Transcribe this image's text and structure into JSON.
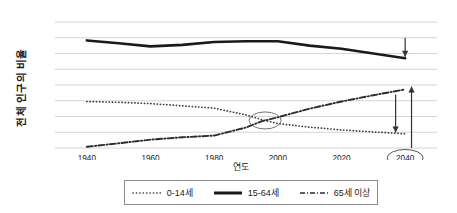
{
  "chart_data": {
    "type": "line",
    "title": "",
    "xlabel": "연도",
    "ylabel": "전체 인구의 비율",
    "xlim": [
      1930,
      2050
    ],
    "ylim": [
      0,
      80
    ],
    "yticks": [
      0,
      10,
      20,
      30,
      40,
      50,
      60,
      70,
      80
    ],
    "xticks": [
      1940,
      1960,
      1980,
      2000,
      2020,
      2040
    ],
    "grid": true,
    "legend_position": "bottom",
    "x": [
      1940,
      1950,
      1960,
      1970,
      1980,
      1990,
      1995,
      2000,
      2010,
      2020,
      2030,
      2040
    ],
    "series": [
      {
        "name": "0-14세",
        "style": "dotted",
        "color": "#3b3b3b",
        "values": [
          29.5,
          29.0,
          28.2,
          26.8,
          25.3,
          21.0,
          18.0,
          15.5,
          13.2,
          11.5,
          10.2,
          9.0
        ]
      },
      {
        "name": "15-64세",
        "style": "solid",
        "color": "#1a1a1a",
        "values": [
          68.3,
          66.5,
          64.5,
          65.5,
          67.3,
          67.8,
          67.8,
          67.8,
          65.0,
          63.0,
          60.0,
          57.0
        ]
      },
      {
        "name": "65세 이상",
        "style": "dash-dot",
        "color": "#2b2b2b",
        "values": [
          0.8,
          3.0,
          5.3,
          6.8,
          7.9,
          13.0,
          17.0,
          19.5,
          25.0,
          29.5,
          33.5,
          37.2
        ]
      }
    ],
    "annotations": [
      {
        "name": "crossover-ellipse",
        "kind": "ellipse",
        "x": 1996,
        "y": 17.5,
        "label": ""
      },
      {
        "name": "highlight-2040-ellipse",
        "kind": "ellipse-axis-label",
        "x": 2040,
        "label": "2040"
      },
      {
        "name": "decline-arrow-working-age",
        "kind": "arrow-down",
        "x": 2040,
        "from_y": 70,
        "to_y": 58
      },
      {
        "name": "decline-arrow-children",
        "kind": "arrow-down",
        "x": 2037,
        "from_y": 34,
        "to_y": 10
      },
      {
        "name": "increase-arrow-elderly",
        "kind": "arrow-up",
        "x": 2042,
        "from_y": 0,
        "to_y": 39
      }
    ]
  },
  "axis": {
    "y_title": "전체 인구의 비율",
    "x_title": "연도",
    "y_tick_labels": [
      "80",
      "70",
      "60",
      "50",
      "40",
      "30",
      "20",
      "10",
      "0"
    ],
    "x_tick_labels": [
      "1940",
      "1960",
      "1980",
      "2000",
      "2020",
      "2040"
    ]
  },
  "legend": {
    "items": [
      {
        "label": "0-14세",
        "style": "dotted"
      },
      {
        "label": "15-64세",
        "style": "solid"
      },
      {
        "label": "65세 이상",
        "style": "dash-dot"
      }
    ]
  }
}
